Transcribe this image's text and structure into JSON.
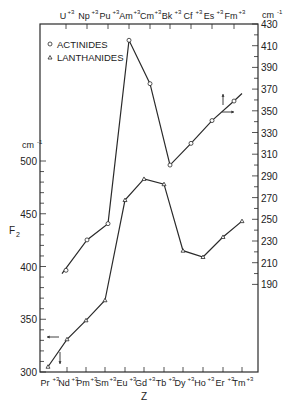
{
  "chart_data": {
    "type": "line",
    "title": "",
    "xlabel": "Z",
    "ylabel_left": "F₂",
    "unit_left": "cm⁻¹",
    "unit_right": "cm⁻¹",
    "ylim_left": [
      300,
      500
    ],
    "ylim_right": [
      190,
      430
    ],
    "left_ticks": [
      300,
      350,
      400,
      450,
      500
    ],
    "right_ticks": [
      430,
      410,
      390,
      370,
      350,
      330,
      310,
      290,
      270,
      250,
      230,
      210,
      190
    ],
    "grid": false,
    "legend": [
      {
        "marker": "circle",
        "label": "ACTINIDES"
      },
      {
        "marker": "triangle",
        "label": "LANTHANIDES"
      }
    ],
    "legend_position": "upper-left",
    "series": [
      {
        "name": "ACTINIDES",
        "axis": "right (top x-axis)",
        "marker": "circle",
        "categories": [
          "U+3",
          "Np+3",
          "Pu+3",
          "Am+3",
          "Cm+3",
          "Bk+3",
          "Cf+3",
          "Es+3",
          "Fm+3"
        ],
        "values": [
          203,
          231,
          246,
          415,
          375,
          300,
          320,
          341,
          359
        ]
      },
      {
        "name": "LANTHANIDES",
        "axis": "left (bottom x-axis)",
        "marker": "triangle",
        "categories": [
          "Pr+3",
          "Nd+3",
          "Pm+3",
          "Sm+3",
          "Eu+3",
          "Gd+3",
          "Tb+3",
          "Dy+3",
          "Ho+3",
          "Er+3",
          "Tm+3"
        ],
        "values": [
          305,
          331,
          349,
          368,
          463,
          483,
          478,
          415,
          409,
          428,
          443
        ]
      }
    ],
    "annotations": [
      "arrow pointing left near Nd (lanthanides use left axis)",
      "arrow pointing down (lanthanides use bottom axis)",
      "arrow pointing up near Es-Fm (actinides use top axis)",
      "arrow pointing right near Es-Fm (actinides use right axis)"
    ]
  },
  "labels": {
    "top_axis": [
      "U",
      "Np",
      "Pu",
      "Am",
      "Cm",
      "Bk",
      "Cf",
      "Es",
      "Fm"
    ],
    "bottom_axis": [
      "Pr",
      "Nd",
      "Pm",
      "Sm",
      "Eu",
      "Gd",
      "Tb",
      "Dy",
      "Ho",
      "Er",
      "Tm"
    ],
    "charge": "+3",
    "legend_actinides": "ACTINIDES",
    "legend_lanthanides": "LANTHANIDES",
    "xlabel": "Z",
    "ylabel_left": "F",
    "ylabel_left_sub": "2",
    "unit": "cm",
    "unit_exp": "-1"
  }
}
